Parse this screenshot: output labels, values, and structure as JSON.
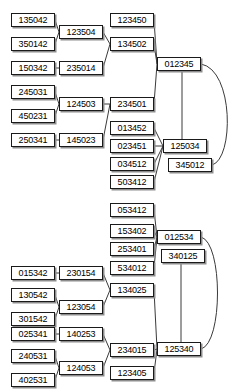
{
  "meta": {
    "node_width": 44,
    "node_height": 14,
    "font_size_px": 9
  },
  "colors": {
    "background": "#ffffff",
    "node_border": "#1a1a1a",
    "node_fill": "#ffffff",
    "node_shadow": "#8d8d8d",
    "edge": "#3a3a3a",
    "text": "#000000"
  },
  "diagrams": [
    {
      "id": "top-diagram",
      "name": "diagram-top",
      "nodes": [
        {
          "id": "t1",
          "label": "135042",
          "x": 11,
          "y": 13
        },
        {
          "id": "t2",
          "label": "350142",
          "x": 11,
          "y": 37
        },
        {
          "id": "t3",
          "label": "150342",
          "x": 11,
          "y": 61
        },
        {
          "id": "t4",
          "label": "245031",
          "x": 11,
          "y": 85
        },
        {
          "id": "t5",
          "label": "450231",
          "x": 11,
          "y": 109
        },
        {
          "id": "t6",
          "label": "250341",
          "x": 11,
          "y": 133
        },
        {
          "id": "t7",
          "label": "123504",
          "x": 59,
          "y": 25
        },
        {
          "id": "t8",
          "label": "235014",
          "x": 59,
          "y": 61
        },
        {
          "id": "t9",
          "label": "124503",
          "x": 59,
          "y": 97
        },
        {
          "id": "t10",
          "label": "145023",
          "x": 59,
          "y": 133
        },
        {
          "id": "t11",
          "label": "123450",
          "x": 110,
          "y": 13
        },
        {
          "id": "t12",
          "label": "134502",
          "x": 110,
          "y": 37
        },
        {
          "id": "t13",
          "label": "234501",
          "x": 110,
          "y": 97
        },
        {
          "id": "t14",
          "label": "013452",
          "x": 110,
          "y": 121
        },
        {
          "id": "t15",
          "label": "023451",
          "x": 110,
          "y": 139
        },
        {
          "id": "t16",
          "label": "034512",
          "x": 110,
          "y": 157
        },
        {
          "id": "t17",
          "label": "503412",
          "x": 110,
          "y": 175
        },
        {
          "id": "t18",
          "label": "012345",
          "x": 157,
          "y": 57
        },
        {
          "id": "t19",
          "label": "125034",
          "x": 163,
          "y": 139
        },
        {
          "id": "t20",
          "label": "345012",
          "x": 168,
          "y": 158
        }
      ],
      "edges": [
        {
          "from": "t1",
          "to": "t7"
        },
        {
          "from": "t2",
          "to": "t7"
        },
        {
          "from": "t3",
          "to": "t8"
        },
        {
          "from": "t4",
          "to": "t9"
        },
        {
          "from": "t5",
          "to": "t9"
        },
        {
          "from": "t6",
          "to": "t10"
        },
        {
          "from": "t7",
          "to": "t12"
        },
        {
          "from": "t8",
          "to": "t12"
        },
        {
          "from": "t9",
          "to": "t13"
        },
        {
          "from": "t10",
          "to": "t13"
        },
        {
          "from": "t11",
          "to": "t18"
        },
        {
          "from": "t12",
          "to": "t18"
        },
        {
          "from": "t13",
          "to": "t18"
        },
        {
          "from": "t14",
          "to": "t19"
        },
        {
          "from": "t15",
          "to": "t19"
        },
        {
          "from": "t16",
          "to": "t19"
        },
        {
          "from": "t17",
          "to": "t19"
        },
        {
          "from": "t18",
          "to": "t19",
          "style": "vertical"
        },
        {
          "from": "t18",
          "to": "t20",
          "style": "arc-right"
        }
      ]
    },
    {
      "id": "bottom-diagram",
      "name": "diagram-bottom",
      "nodes": [
        {
          "id": "b1",
          "label": "053412",
          "x": 110,
          "y": 203
        },
        {
          "id": "b2",
          "label": "153402",
          "x": 110,
          "y": 224
        },
        {
          "id": "b3",
          "label": "253401",
          "x": 110,
          "y": 242
        },
        {
          "id": "b4",
          "label": "534012",
          "x": 110,
          "y": 261
        },
        {
          "id": "b5",
          "label": "012534",
          "x": 157,
          "y": 230
        },
        {
          "id": "b6",
          "label": "340125",
          "x": 161,
          "y": 249
        },
        {
          "id": "b7",
          "label": "015342",
          "x": 11,
          "y": 266
        },
        {
          "id": "b8",
          "label": "230154",
          "x": 59,
          "y": 266
        },
        {
          "id": "b9",
          "label": "130542",
          "x": 11,
          "y": 288
        },
        {
          "id": "b10",
          "label": "301542",
          "x": 11,
          "y": 312
        },
        {
          "id": "b11",
          "label": "123054",
          "x": 59,
          "y": 300
        },
        {
          "id": "b12",
          "label": "134025",
          "x": 110,
          "y": 283
        },
        {
          "id": "b13",
          "label": "025341",
          "x": 11,
          "y": 327
        },
        {
          "id": "b14",
          "label": "140253",
          "x": 59,
          "y": 327
        },
        {
          "id": "b15",
          "label": "240531",
          "x": 11,
          "y": 349
        },
        {
          "id": "b16",
          "label": "402531",
          "x": 11,
          "y": 373
        },
        {
          "id": "b17",
          "label": "124053",
          "x": 59,
          "y": 361
        },
        {
          "id": "b18",
          "label": "234015",
          "x": 110,
          "y": 343
        },
        {
          "id": "b19",
          "label": "123405",
          "x": 110,
          "y": 366
        },
        {
          "id": "b20",
          "label": "125340",
          "x": 157,
          "y": 342
        }
      ],
      "edges": [
        {
          "from": "b1",
          "to": "b5"
        },
        {
          "from": "b2",
          "to": "b5"
        },
        {
          "from": "b3",
          "to": "b5"
        },
        {
          "from": "b4",
          "to": "b5"
        },
        {
          "from": "b7",
          "to": "b8"
        },
        {
          "from": "b9",
          "to": "b11"
        },
        {
          "from": "b10",
          "to": "b11"
        },
        {
          "from": "b8",
          "to": "b12"
        },
        {
          "from": "b11",
          "to": "b12"
        },
        {
          "from": "b13",
          "to": "b14"
        },
        {
          "from": "b15",
          "to": "b17"
        },
        {
          "from": "b16",
          "to": "b17"
        },
        {
          "from": "b14",
          "to": "b18"
        },
        {
          "from": "b17",
          "to": "b18"
        },
        {
          "from": "b12",
          "to": "b20"
        },
        {
          "from": "b18",
          "to": "b20"
        },
        {
          "from": "b19",
          "to": "b20"
        },
        {
          "from": "b6",
          "to": "b20",
          "style": "vertical"
        },
        {
          "from": "b5",
          "to": "b20",
          "style": "arc-right"
        }
      ]
    }
  ]
}
